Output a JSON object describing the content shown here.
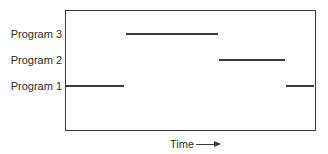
{
  "diagram": {
    "rows": [
      {
        "label": "Program 3"
      },
      {
        "label": "Program 2"
      },
      {
        "label": "Program 1"
      }
    ],
    "x_axis_label": "Time",
    "x_axis_arrow": "right-arrow",
    "segments": [
      {
        "program": "Program 1",
        "start": 0.0,
        "end": 0.24
      },
      {
        "program": "Program 3",
        "start": 0.24,
        "end": 0.61
      },
      {
        "program": "Program 2",
        "start": 0.61,
        "end": 0.88
      },
      {
        "program": "Program 1",
        "start": 0.88,
        "end": 1.0
      }
    ]
  }
}
